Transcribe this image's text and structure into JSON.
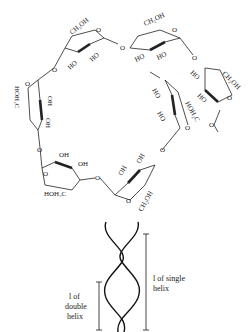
{
  "figure": {
    "top_panel": {
      "description": "Helical chain of alpha-1,4-linked glucose units (amylose)",
      "ring_labels": {
        "ch2oh": "CH₂OH",
        "hoh2c": "HOH₂C",
        "ho": "HO",
        "oh": "OH",
        "o": "O"
      }
    },
    "bottom_panel": {
      "description": "Double helix schematic",
      "label_double_line1": "l of",
      "label_double_line2": "double",
      "label_double_line3": "helix",
      "label_single_line1": "l of single",
      "label_single_line2": "helix"
    }
  },
  "colors": {
    "ink": "#222222",
    "background": "#ffffff"
  }
}
